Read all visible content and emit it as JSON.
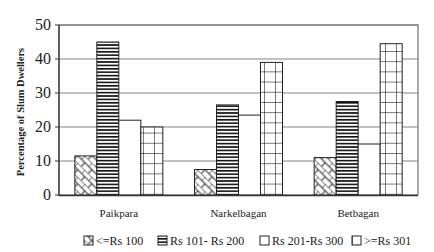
{
  "chart_data": {
    "type": "bar",
    "title": "",
    "xlabel": "",
    "ylabel": "Percentage of Slum Dwellers",
    "ylim": [
      0,
      50
    ],
    "yticks": [
      0,
      10,
      20,
      30,
      40,
      50
    ],
    "grid": true,
    "legend_position": "bottom",
    "categories": [
      "Paikpara",
      "Narkelbagan",
      "Betbagan"
    ],
    "series": [
      {
        "name": "<=Rs 100",
        "pattern": "crosshatch-brick",
        "values": [
          11.5,
          7.5,
          11
        ]
      },
      {
        "name": "Rs 101- Rs 200",
        "pattern": "horizontal-lines",
        "values": [
          45,
          26.5,
          27.5
        ]
      },
      {
        "name": "Rs 201-Rs 300",
        "pattern": "blank",
        "values": [
          22,
          23.5,
          15
        ]
      },
      {
        "name": ">=Rs 301",
        "pattern": "grid",
        "values": [
          20,
          39,
          44.5
        ]
      }
    ]
  },
  "labels": {
    "ylabel": "Percentage of Slum Dwellers",
    "yticks": [
      "0",
      "10",
      "20",
      "30",
      "40",
      "50"
    ],
    "categories": [
      "Paikpara",
      "Narkelbagan",
      "Betbagan"
    ],
    "legend": [
      "<=Rs 100",
      "Rs 101- Rs 200",
      "Rs 201-Rs 300",
      ">=Rs 301"
    ]
  }
}
